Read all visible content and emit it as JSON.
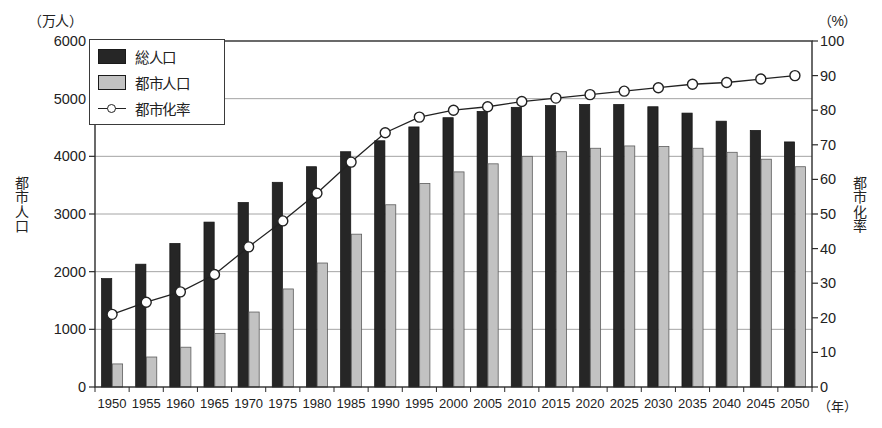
{
  "chart_data": {
    "type": "bar",
    "title": "",
    "subtitle": "",
    "xlabel": "（年）",
    "ylabel": "都市人口",
    "ylabel_right": "都市化率",
    "unit_left": "（万人）",
    "unit_right": "（%）",
    "grid": true,
    "legend_position": "top-left",
    "categories": [
      "1950",
      "1955",
      "1960",
      "1965",
      "1970",
      "1975",
      "1980",
      "1985",
      "1990",
      "1995",
      "2000",
      "2005",
      "2010",
      "2015",
      "2020",
      "2025",
      "2030",
      "2035",
      "2040",
      "2045",
      "2050"
    ],
    "ylim": [
      0,
      6000
    ],
    "yticks": [
      0,
      1000,
      2000,
      3000,
      4000,
      5000,
      6000
    ],
    "ytick_labels": [
      "0",
      "1000",
      "2000",
      "3000",
      "4000",
      "5000",
      "6000"
    ],
    "ylim_right": [
      0,
      100
    ],
    "yticks_right": [
      0,
      10,
      20,
      30,
      40,
      50,
      60,
      70,
      80,
      90,
      100
    ],
    "ytick_labels_right": [
      "0",
      "10",
      "20",
      "30",
      "40",
      "50",
      "60",
      "70",
      "80",
      "90",
      "100"
    ],
    "series": [
      {
        "name": "総人口",
        "kind": "bar",
        "axis": "left",
        "color": "#262626",
        "values": [
          1880,
          2130,
          2490,
          2860,
          3200,
          3550,
          3820,
          4080,
          4270,
          4510,
          4670,
          4780,
          4850,
          4880,
          4900,
          4900,
          4860,
          4750,
          4610,
          4450,
          4250
        ]
      },
      {
        "name": "都市人口",
        "kind": "bar",
        "axis": "left",
        "color": "#c2c2c2",
        "values": [
          400,
          520,
          690,
          930,
          1300,
          1700,
          2150,
          2650,
          3160,
          3530,
          3730,
          3870,
          4000,
          4080,
          4140,
          4180,
          4170,
          4140,
          4070,
          3950,
          3820
        ]
      },
      {
        "name": "都市化率",
        "kind": "line",
        "axis": "right",
        "color": "#222222",
        "marker": "open-circle",
        "values": [
          21,
          24.5,
          27.5,
          32.5,
          40.5,
          48,
          56,
          65,
          73.5,
          78,
          80,
          81,
          82.5,
          83.5,
          84.5,
          85.5,
          86.5,
          87.5,
          88,
          89,
          90
        ]
      }
    ]
  },
  "legend": {
    "items": [
      {
        "label": "総人口",
        "type": "swatch-dark"
      },
      {
        "label": "都市人口",
        "type": "swatch-light"
      },
      {
        "label": "都市化率",
        "type": "line-marker"
      }
    ]
  }
}
